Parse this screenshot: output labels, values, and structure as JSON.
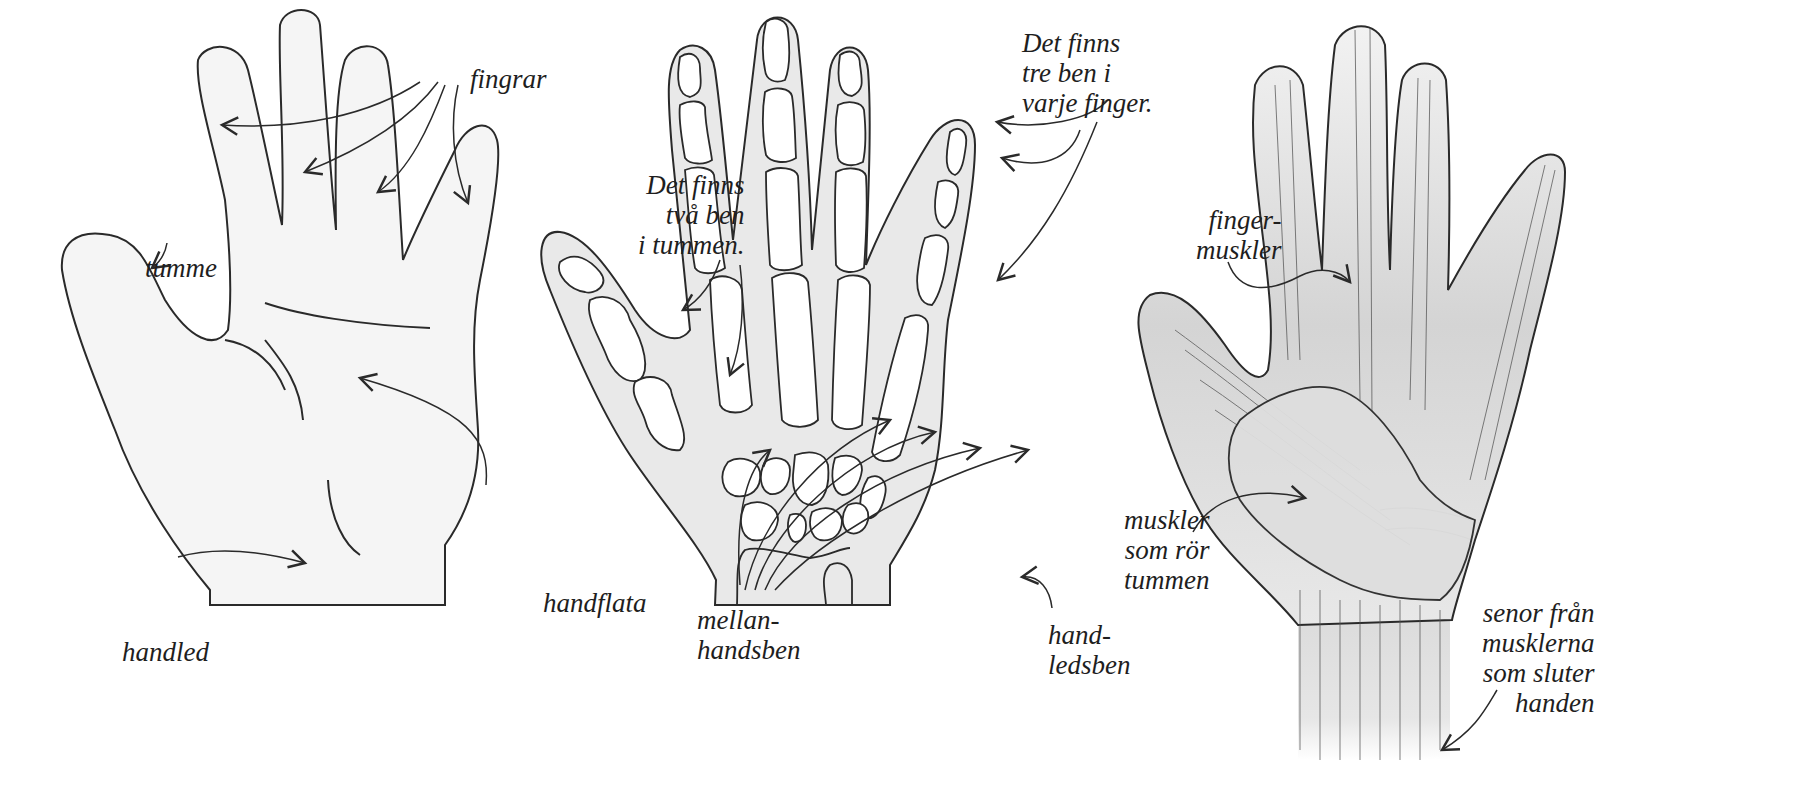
{
  "figure": {
    "language": "Swedish",
    "panels": [
      {
        "id": "outline",
        "labels": {
          "fingers": "fingrar",
          "thumb": "tumme",
          "palm": "handflata",
          "wrist": "handled"
        }
      },
      {
        "id": "bones",
        "labels": {
          "three_bones": "Det finns\ntre ben i\nvarje finger.",
          "two_bones": "Det finns\ntvå ben\ni tummen.",
          "metacarpals": "mellan-\nhandsben",
          "carpals": "hand-\nledsben"
        }
      },
      {
        "id": "muscles",
        "labels": {
          "finger_muscles": "finger-\nmuskler",
          "thumb_muscles": "muskler\nsom rör\ntummen",
          "tendons": "senor från\nmusklerna\nsom sluter\nhanden"
        }
      }
    ],
    "colors": {
      "ink": "#2a2a2a",
      "skin_fill": "#f4f4f4",
      "bone_fill": "#ffffff",
      "muscle_fill": "#d9d9d9",
      "background": "#ffffff"
    }
  }
}
